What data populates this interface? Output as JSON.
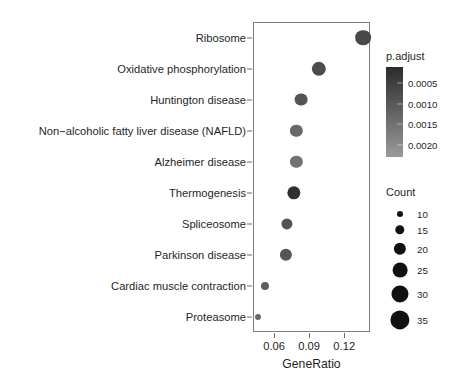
{
  "chart_data": {
    "type": "scatter",
    "title": "",
    "subtitle": "",
    "xlabel": "GeneRatio",
    "ylabel": "",
    "xlim": [
      0.042,
      0.142
    ],
    "xticks": [
      0.06,
      0.09,
      0.12
    ],
    "xticklabels": [
      "0.06",
      "0.09",
      "0.12"
    ],
    "grid": false,
    "categories": [
      "Ribosome",
      "Oxidative phosphorylation",
      "Huntington disease",
      "Non−alcoholic fatty liver disease (NAFLD)",
      "Alzheimer disease",
      "Thermogenesis",
      "Spliceosome",
      "Parkinson disease",
      "Cardiac muscle contraction",
      "Proteasome"
    ],
    "points": [
      {
        "label": "Ribosome",
        "GeneRatio": 0.136,
        "Count": 27,
        "p.adjust": 0.00068
      },
      {
        "label": "Oxidative phosphorylation",
        "GeneRatio": 0.098,
        "Count": 24,
        "p.adjust": 0.00075
      },
      {
        "label": "Huntington disease",
        "GeneRatio": 0.083,
        "Count": 21,
        "p.adjust": 0.00092
      },
      {
        "label": "Non−alcoholic fatty liver disease (NAFLD)",
        "GeneRatio": 0.079,
        "Count": 20,
        "p.adjust": 0.0013
      },
      {
        "label": "Alzheimer disease",
        "GeneRatio": 0.079,
        "Count": 20,
        "p.adjust": 0.0015
      },
      {
        "label": "Thermogenesis",
        "GeneRatio": 0.077,
        "Count": 22,
        "p.adjust": 0.00018
      },
      {
        "label": "Spliceosome",
        "GeneRatio": 0.071,
        "Count": 18,
        "p.adjust": 0.0009
      },
      {
        "label": "Parkinson disease",
        "GeneRatio": 0.07,
        "Count": 20,
        "p.adjust": 0.00095
      },
      {
        "label": "Cardiac muscle contraction",
        "GeneRatio": 0.052,
        "Count": 13,
        "p.adjust": 0.0011
      },
      {
        "label": "Proteasome",
        "GeneRatio": 0.046,
        "Count": 10,
        "p.adjust": 0.0013
      }
    ],
    "legends": {
      "color": {
        "title": "p.adjust",
        "ticks": [
          0.0005,
          0.001,
          0.0015,
          0.002
        ],
        "ticklabels": [
          "0.0005",
          "0.0010",
          "0.0015",
          "0.0020"
        ],
        "range": [
          0.0001,
          0.0023
        ],
        "low_color": "#2b2b2b",
        "high_color": "#9a9a9a",
        "position": "right-top"
      },
      "size": {
        "title": "Count",
        "breaks": [
          10,
          15,
          20,
          25,
          30,
          35
        ],
        "breaklabels": [
          "10",
          "15",
          "20",
          "25",
          "30",
          "35"
        ],
        "dot_color": "#111111",
        "position": "right-bottom"
      }
    }
  },
  "axis": {
    "x_title": "GeneRatio",
    "x_ticklabels": [
      "0.06",
      "0.09",
      "0.12"
    ],
    "y_ticklabels": [
      "Ribosome",
      "Oxidative phosphorylation",
      "Huntington disease",
      "Non−alcoholic fatty liver disease (NAFLD)",
      "Alzheimer disease",
      "Thermogenesis",
      "Spliceosome",
      "Parkinson disease",
      "Cardiac muscle contraction",
      "Proteasome"
    ]
  },
  "legend_color": {
    "title": "p.adjust",
    "labels": [
      "0.0005",
      "0.0010",
      "0.0015",
      "0.0020"
    ]
  },
  "legend_size": {
    "title": "Count",
    "labels": [
      "10",
      "15",
      "20",
      "25",
      "30",
      "35"
    ]
  },
  "colors": {
    "panel_border": "#7d7d7d",
    "text": "#1f1f1f",
    "dot_dark": "#2b2b2b",
    "dot_light": "#9a9a9a",
    "background": "#ffffff"
  }
}
